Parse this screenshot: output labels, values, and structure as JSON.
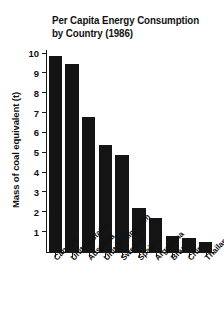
{
  "chart_data": {
    "type": "bar",
    "title": "Per Capita Energy Consumption by Country (1986)",
    "title_lines": [
      "Per Capita Energy Consumption",
      "by Country (1986)"
    ],
    "xlabel": "",
    "ylabel": "Mass of coal equivalent (t)",
    "categories": [
      "Canada",
      "United States",
      "Australia",
      "United Kingdom",
      "Sweden",
      "Spain",
      "Argentina",
      "Brazil",
      "China",
      "Thailand"
    ],
    "values": [
      9.9,
      9.5,
      6.8,
      5.4,
      4.9,
      2.2,
      1.7,
      0.8,
      0.7,
      0.5
    ],
    "ylim": [
      0,
      10
    ],
    "ytick_labels": [
      "1",
      "2",
      "3",
      "4",
      "5",
      "6",
      "7",
      "8",
      "9",
      "10"
    ],
    "ytick_values": [
      1,
      2,
      3,
      4,
      5,
      6,
      7,
      8,
      9,
      10
    ],
    "grid": false,
    "legend": false,
    "bar_color": "#141414",
    "background_color": "#ffffff",
    "axis_color": "#1a1a1a"
  }
}
